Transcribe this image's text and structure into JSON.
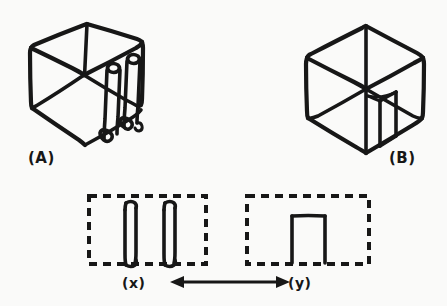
{
  "page": {
    "background_color": "#fafaf9",
    "ink_color": "#171717",
    "width": 447,
    "height": 306
  },
  "figures": {
    "top_left": {
      "label": "(A)",
      "name": "two-pronged-cube",
      "description": "hand-drawn wireframe cube containing two rounded cylindrical prongs"
    },
    "top_right": {
      "label": "(B)",
      "name": "single-block-cube",
      "description": "hand-drawn wireframe cube containing one rectangular block flap"
    },
    "bottom_left": {
      "label": "(x)",
      "name": "two-prongs-detail",
      "description": "dashed region enclosing two rounded vertical prongs"
    },
    "bottom_right": {
      "label": "(y)",
      "name": "single-rectangle-detail",
      "description": "dashed region enclosing one open-bottom rectangle"
    }
  },
  "connector": {
    "name": "double-headed-arrow",
    "label": "",
    "direction": "both"
  }
}
